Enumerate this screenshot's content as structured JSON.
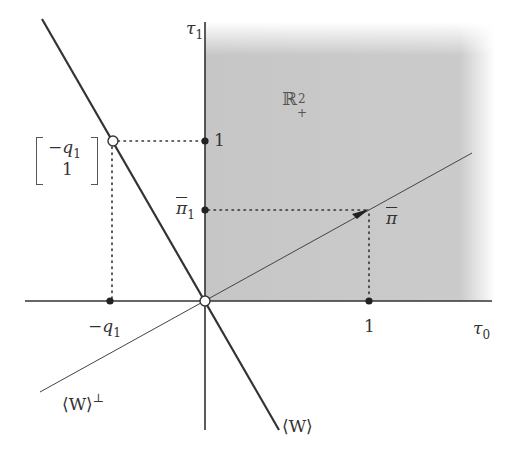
{
  "figure": {
    "type": "vector-cone-diagram",
    "region_label": "ℝ",
    "region_sup": "2",
    "region_sub": "+",
    "axes": {
      "x_label": "τ",
      "x_sub": "0",
      "y_label": "τ",
      "y_sub": "1"
    },
    "ticks": {
      "x_one": "1",
      "y_one": "1",
      "x_neg_q1_sign": "−",
      "x_neg_q1_var": "q",
      "x_neg_q1_sub": "1",
      "y_pi1_var": "π",
      "y_pi1_sub": "1"
    },
    "points": {
      "pi_bar": "π",
      "vector_top": "−",
      "vector_var": "q",
      "vector_sub": "1",
      "vector_bottom": "1"
    },
    "lines": {
      "w_label": "⟨W⟩",
      "w_perp_label": "⟨W⟩",
      "w_perp_sup": "⊥"
    },
    "colors": {
      "shade": "#c8c8c8",
      "line": "#333333",
      "background": "#ffffff"
    }
  }
}
